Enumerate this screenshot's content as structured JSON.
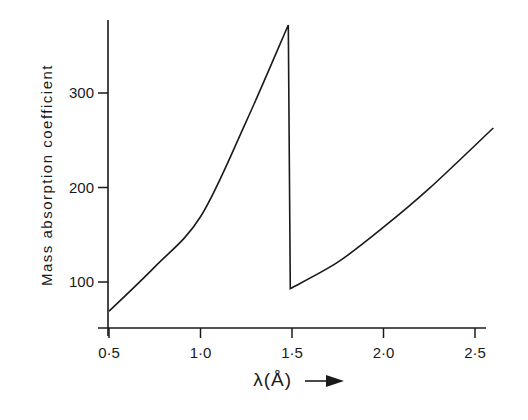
{
  "chart_data": {
    "type": "line",
    "title": "",
    "xlabel": "λ(Å)",
    "xlabel_arrow": "→",
    "ylabel": "Mass absorption coefficient",
    "x_ticks": [
      0.5,
      1.0,
      1.5,
      2.0,
      2.5
    ],
    "x_tick_labels": [
      "0·5",
      "1·0",
      "1·5",
      "2·0",
      "2·5"
    ],
    "y_ticks": [
      100,
      200,
      300
    ],
    "y_tick_labels": [
      "100",
      "200",
      "300"
    ],
    "xlim": [
      0.5,
      2.6
    ],
    "ylim": [
      50,
      380
    ],
    "grid": false,
    "legend": null,
    "annotations": [
      "Absorption edge near λ ≈ 1.48 Å"
    ],
    "series": [
      {
        "name": "Mass absorption coefficient",
        "x": [
          0.5,
          0.75,
          1.0,
          1.25,
          1.48,
          1.48,
          1.75,
          2.0,
          2.25,
          2.6
        ],
        "y": [
          69,
          116,
          169,
          270,
          372,
          93,
          121,
          158,
          199,
          263
        ]
      }
    ]
  }
}
